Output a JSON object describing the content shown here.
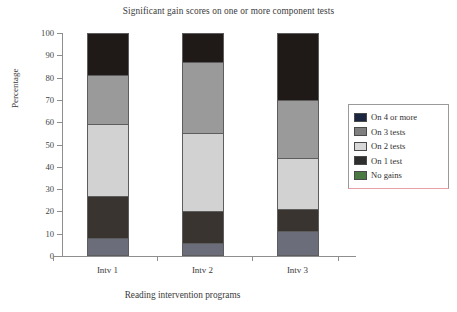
{
  "chart_data": {
    "type": "bar",
    "stacked": true,
    "title": "Significant gain scores on one or more component tests",
    "xlabel": "Reading intervention programs",
    "ylabel": "Percentage",
    "categories": [
      "Intv 1",
      "Intv 2",
      "Intv 3"
    ],
    "ylim": [
      0,
      100
    ],
    "ytick_labels": [
      "0",
      "10",
      "20",
      "30",
      "40",
      "50",
      "60",
      "70",
      "80",
      "90",
      "100"
    ],
    "ytick_values": [
      0,
      10,
      20,
      30,
      40,
      50,
      60,
      70,
      80,
      90,
      100
    ],
    "grid": false,
    "legend_position": "right",
    "series": [
      {
        "name": "No gains",
        "color": "#6b6d7a",
        "values": [
          8,
          6,
          11
        ]
      },
      {
        "name": "On 1 test",
        "color": "#3a3431",
        "values": [
          19,
          14,
          10
        ]
      },
      {
        "name": "On 2 tests",
        "color": "#d2d2d2",
        "values": [
          32,
          35,
          23
        ]
      },
      {
        "name": "On 3 tests",
        "color": "#9a9a9a",
        "values": [
          22,
          32,
          26
        ]
      },
      {
        "name": "On 4 or more",
        "color": "#1f1a18",
        "values": [
          19,
          13,
          30
        ]
      }
    ],
    "cumulative_tops": {
      "Intv 1": [
        8,
        27,
        59,
        81,
        100
      ],
      "Intv 2": [
        6,
        20,
        55,
        87,
        100
      ],
      "Intv 3": [
        11,
        21,
        44,
        70,
        100
      ]
    }
  },
  "legend": {
    "entries": [
      {
        "label": "On 4 or more",
        "color": "#1b2540"
      },
      {
        "label": "On 3 tests",
        "color": "#7f7f7f"
      },
      {
        "label": "On 2 tests",
        "color": "#d7d7d7"
      },
      {
        "label": "On 1 test",
        "color": "#2e2e2e"
      },
      {
        "label": "No gains",
        "color": "#4a7a42"
      }
    ]
  },
  "colors": {
    "axis": "#8e8e8e",
    "text": "#3a3a3a",
    "legend_border": "#9a9a9a",
    "legend_underline": "#e8a0a8",
    "background": "#ffffff"
  }
}
